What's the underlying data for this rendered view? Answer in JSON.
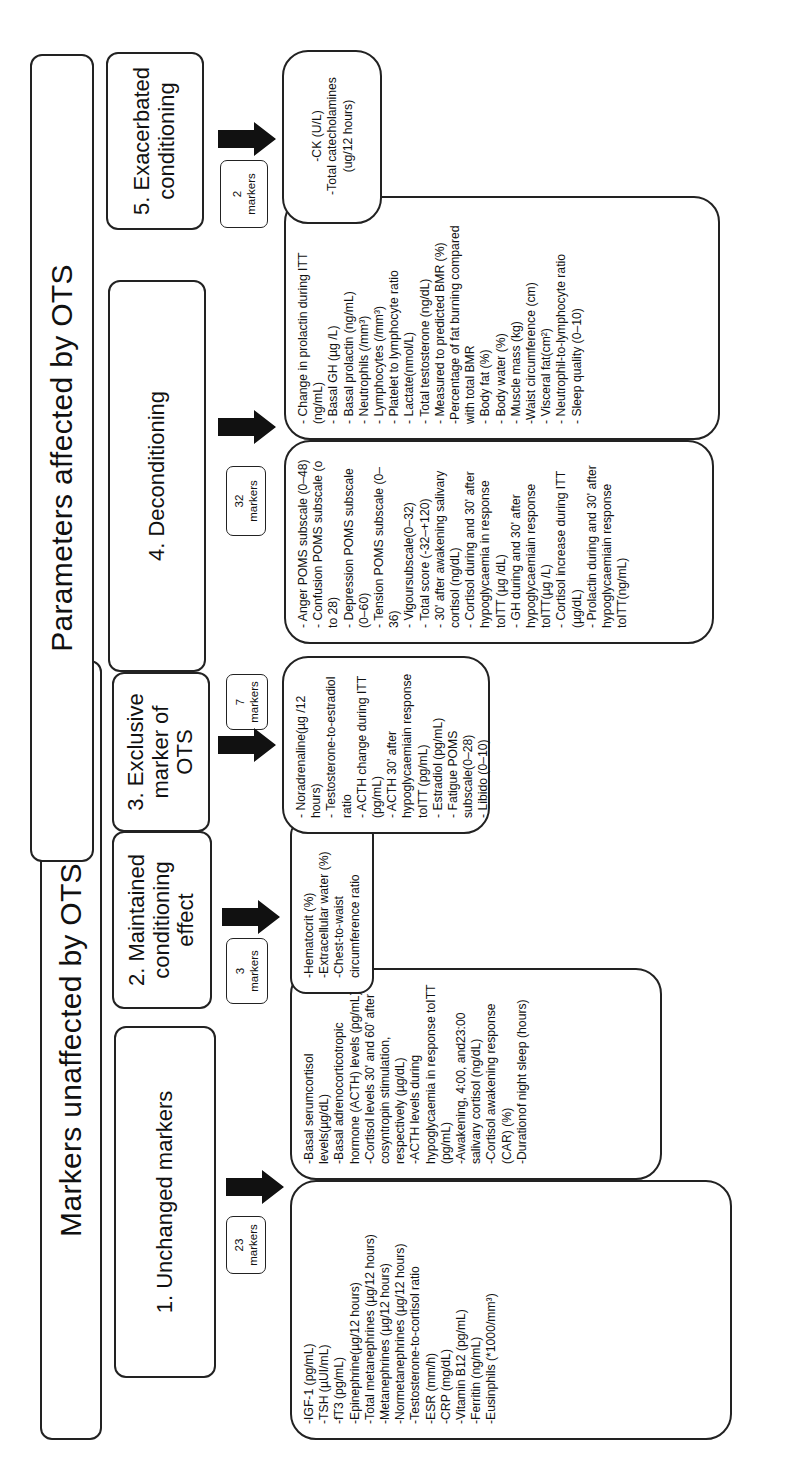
{
  "headers": {
    "unaffected": "Markers unaffected by OTS",
    "affected": "Parameters affected by OTS"
  },
  "categories": [
    {
      "id": 1,
      "title": "1. Unchanged markers",
      "badge": {
        "count": "23",
        "label": "markers"
      },
      "columns": [
        [
          "-IGF-1 (pg/mL)",
          "-TSH (µUI/mL)",
          "-fT3 (pg/mL)",
          "-Epinephrine(µg/12 hours)",
          "-Total metanephrines (µg/12 hours)",
          "-Metanephrines (µg/12 hours)",
          "-Normetanephrines (µg/12 hours)",
          "-Testosterone-to-cortisol ratio",
          "-ESR (mm/h)",
          "-CRP (mg/dL)",
          "-Vitamin B12 (pg/mL)",
          "-Ferritin (ng/mL)",
          "-Eusinphils (*1000/mm³)"
        ],
        [
          "-Basal serumcortisol levels(µg/dL)",
          "-Basal adrenocorticotropic hormone (ACTH) levels (pg/mL)",
          "-Cortisol levels 30' and 60' after cosyntropin stimulation, respectively (µg/dL)",
          "-ACTH levels during hypoglycaemia in response toITT (pg/mL)",
          "-Awakening, 4:00, and23:00 salivary cortisol (ng/dL)",
          "-Cortisol awakening response (CAR) (%)",
          "-Durationof night sleep (hours)"
        ]
      ]
    },
    {
      "id": 2,
      "title": "2. Maintained conditioning effect",
      "badge": {
        "count": "3",
        "label": "markers"
      },
      "columns": [
        [
          "-Hematocrit (%)",
          "-Extracellular water (%)",
          "-Chest-to-waist circumference ratio"
        ]
      ]
    },
    {
      "id": 3,
      "title": "3. Exclusive marker of OTS",
      "badge": {
        "count": "7",
        "label": "markers"
      },
      "columns": [
        [
          "- Noradrenaline(µg /12 hours)",
          "- Testosterone-to-estradiol ratio",
          "- ACTH change during ITT (pg/mL)",
          "- ACTH 30' after hypoglycaemiain response toITT (pg/mL)",
          "- Estradiol (pg/mL)",
          "- Fatigue POMS subscale(0–28)",
          "- Libido (0–10)"
        ]
      ]
    },
    {
      "id": 4,
      "title": "4. Deconditioning",
      "badge": {
        "count": "32",
        "label": "markers"
      },
      "columns": [
        [
          "- Anger POMS subscale (0–48)",
          "- Confusion POMS subscale (o to 28)",
          "- Depression POMS subscale (0–60)",
          "- Tension POMS subscale (0–36)",
          "- Vigoursubscale(0–32)",
          "- Total score (-32–+120)",
          "- 30' after awakening salivary cortisol (ng/dL)",
          "- Cortisol during and 30' after hypoglycaemia in response toITT (µg /dL)",
          "- GH during and 30' after hypoglycaemiain response toITT(µg /L)",
          "- Cortisol increase during ITT (µg/dL)",
          "- Prolactin during and 30' after hypoglycaemiain response toITT(ng/mL)"
        ],
        [
          "- Change in prolactin during ITT (ng/mL)",
          "- Basal GH (µg /L)",
          "- Basal prolactin (ng/mL)",
          "- Neutrophils (/mm³)",
          "- Lymphocytes (/mm³)",
          "- Platelet to lymphocyte ratio",
          "- Lactate(nmol/L)",
          "- Total testosterone (ng/dL)",
          "- Measured to predicted BMR (%)",
          "-Percentage of fat burning compared with total BMR",
          "- Body fat (%)",
          "- Body water (%)",
          "- Muscle mass (kg)",
          "-Waist circumference (cm)",
          "- Visceral fat(cm²)",
          "- Neutrophil-to-lymphocyte ratio",
          "- Sleep quality (0–10)"
        ]
      ]
    },
    {
      "id": 5,
      "title": "5. Exacerbated conditioning",
      "badge": {
        "count": "2",
        "label": "markers"
      },
      "columns": [
        [
          "-CK (U/L)",
          "-Total catecholamines (ug/12 hours)"
        ]
      ]
    }
  ],
  "icons": {
    "arrow": "arrow-down-icon"
  },
  "colors": {
    "stroke": "#222222",
    "arrow_fill": "#111111",
    "background": "#ffffff"
  }
}
